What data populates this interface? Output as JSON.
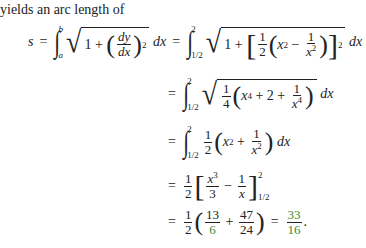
{
  "intro_text": "yields an arc length of",
  "equation": {
    "lhs_var": "s",
    "generic_integral": {
      "lower": "a",
      "upper": "b",
      "integrand": "√(1 + (dy/dx)²) dx"
    },
    "steps": [
      {
        "lower": "1/2",
        "upper": "2",
        "expr": "√(1 + [½(x² − 1/x²)]²) dx"
      },
      {
        "lower": "1/2",
        "upper": "2",
        "expr": "√(¼(x⁴ + 2 + 1/x⁴)) dx"
      },
      {
        "lower": "1/2",
        "upper": "2",
        "expr": "½(x² + 1/x²) dx"
      },
      {
        "expr": "½[x³/3 − 1/x] from 1/2 to 2"
      },
      {
        "expr": "½(13/6 + 47/24) = 33/16."
      }
    ],
    "result": {
      "numerator": "33",
      "denominator": "16"
    },
    "highlight_color": "#3a8a3a"
  },
  "sym": {
    "eq": "=",
    "plus": "+",
    "minus": "−",
    "one": "1",
    "two": "2",
    "four": "4",
    "three": "3",
    "dx": "dx",
    "dy": "dy",
    "x": "x",
    "half": "1/2",
    "b": "b",
    "a": "a",
    "s": "s",
    "period": "."
  },
  "final": {
    "n1": "13",
    "d1": "6",
    "n2": "47",
    "d2": "24",
    "rn": "33",
    "rd": "16"
  }
}
